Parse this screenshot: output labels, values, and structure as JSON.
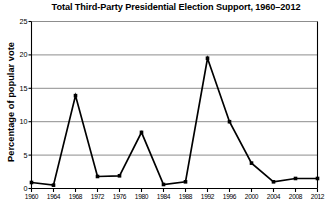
{
  "chart_data": {
    "type": "line",
    "title": "Total Third-Party Presidential Election Support, 1960–2012",
    "xlabel": "",
    "ylabel": "Percentage of popular vote",
    "categories": [
      "1960",
      "1964",
      "1968",
      "1972",
      "1976",
      "1980",
      "1984",
      "1988",
      "1992",
      "1996",
      "2000",
      "2004",
      "2008",
      "2012"
    ],
    "x": [
      1960,
      1964,
      1968,
      1972,
      1976,
      1980,
      1984,
      1988,
      1992,
      1996,
      2000,
      2004,
      2008,
      2012
    ],
    "values": [
      0.9,
      0.5,
      13.9,
      1.8,
      1.9,
      8.4,
      0.6,
      1.0,
      19.5,
      10.0,
      3.8,
      1.0,
      1.5,
      1.5
    ],
    "ylim": [
      0,
      25
    ],
    "yticks": [
      0,
      5,
      10,
      15,
      20,
      25
    ],
    "ytick_labels": [
      "0",
      "5",
      "10",
      "15",
      "20",
      "25"
    ],
    "xlim": [
      1960,
      2012
    ],
    "grid": "horizontal",
    "legend": "none",
    "marker": "square",
    "line_color": "#000000",
    "marker_color": "#000000",
    "grid_color": "#808080",
    "axis_color": "#000000",
    "background": "#ffffff"
  }
}
